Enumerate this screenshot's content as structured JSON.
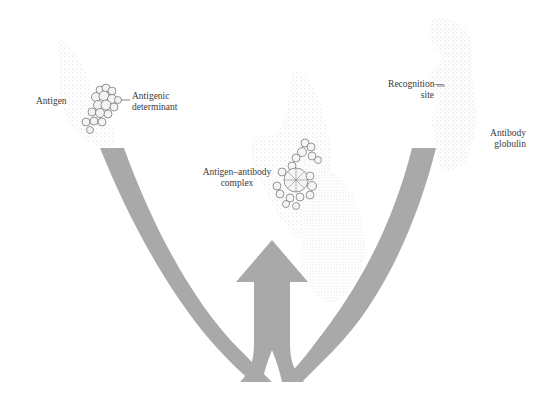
{
  "diagram": {
    "type": "antigen-antibody binding illustration",
    "colors": {
      "arrow": "#a9a9a9",
      "stipple": "#d8d8d8",
      "molecule_outline": "#555555",
      "text": "#3a3a3a",
      "background": "#ffffff"
    },
    "labels": {
      "antigen": "Antigen",
      "antigenic_determinant_line1": "Antigenic",
      "antigenic_determinant_line2": "determinant",
      "complex_line1": "Antigen–antibody",
      "complex_line2": "complex",
      "recognition_line1": "Recognition—",
      "recognition_line2": "site",
      "antibody_line1": "Antibody",
      "antibody_line2": "globulin"
    },
    "nodes": [
      {
        "id": "antigen",
        "label": "Antigen",
        "position": "top-left"
      },
      {
        "id": "antibody",
        "label": "Antibody globulin",
        "position": "top-right"
      },
      {
        "id": "complex",
        "label": "Antigen–antibody complex",
        "position": "top-center"
      }
    ],
    "edges": [
      {
        "from": "antigen",
        "to": "complex",
        "style": "curved gray band merging into upward arrow"
      },
      {
        "from": "antibody",
        "to": "complex",
        "style": "curved gray band merging into upward arrow"
      }
    ]
  }
}
